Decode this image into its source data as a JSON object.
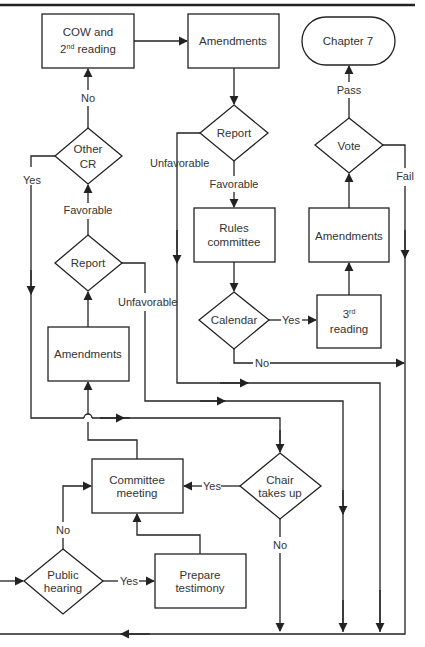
{
  "diagram": {
    "type": "flowchart",
    "colors": {
      "stroke": "#222222",
      "text": "#333333",
      "background": "#ffffff"
    },
    "nodes": {
      "cow": {
        "line1": "COW and",
        "line2_base": "2",
        "line2_sup": "nd",
        "line2_rest": " reading"
      },
      "amendments_top": {
        "label": "Amendments"
      },
      "chapter7": {
        "label": "Chapter 7"
      },
      "report_upper": {
        "label": "Report"
      },
      "vote": {
        "label": "Vote"
      },
      "other_cr": {
        "line1": "Other",
        "line2": "CR"
      },
      "rules_committee": {
        "line1": "Rules",
        "line2": "committee"
      },
      "amendments_right": {
        "label": "Amendments"
      },
      "report_lower": {
        "label": "Report"
      },
      "calendar": {
        "label": "Calendar"
      },
      "third_reading": {
        "line1_base": "3",
        "line1_sup": "rd",
        "line2": "reading"
      },
      "amendments_left": {
        "label": "Amendments"
      },
      "committee_meeting": {
        "line1": "Committee",
        "line2": "meeting"
      },
      "chair_takes_up": {
        "line1": "Chair",
        "line2": "takes up"
      },
      "public_hearing": {
        "line1": "Public",
        "line2": "hearing"
      },
      "prepare_testimony": {
        "line1": "Prepare",
        "line2": "testimony"
      }
    },
    "edge_labels": {
      "other_cr_no": "No",
      "other_cr_yes": "Yes",
      "report_upper_unfavorable": "Unfavorable",
      "report_upper_favorable": "Favorable",
      "report_lower_favorable": "Favorable",
      "report_lower_unfavorable": "Unfavorable",
      "vote_pass": "Pass",
      "vote_fail": "Fail",
      "calendar_yes": "Yes",
      "calendar_no": "No",
      "chair_yes": "Yes",
      "chair_no": "No",
      "public_hearing_no": "No",
      "public_hearing_yes": "Yes"
    }
  }
}
